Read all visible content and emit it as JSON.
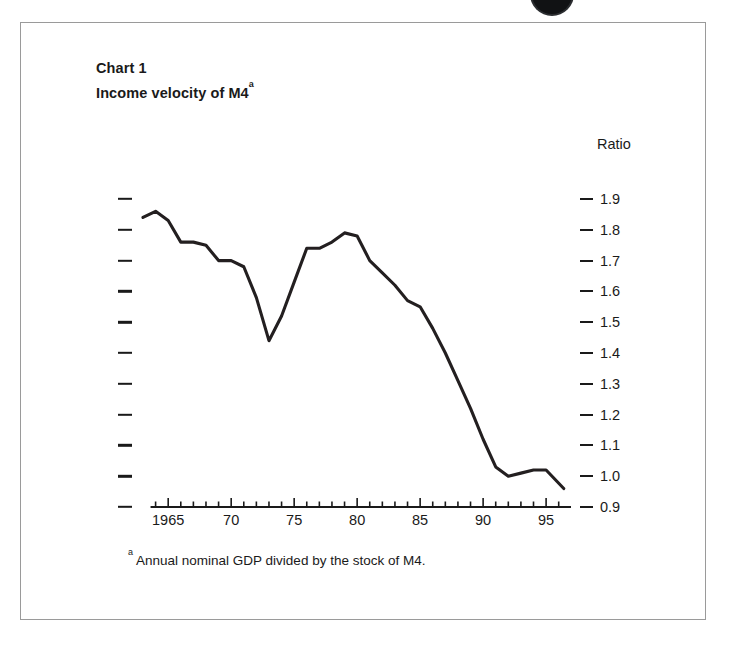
{
  "page": {
    "background": "#ffffff",
    "ink": "#1a1a1a",
    "frame_color": "#9a9a9a",
    "artifact": "page-edge-dark-circle"
  },
  "titles": {
    "chart_number": "Chart 1",
    "chart_title": "Income velocity of M4",
    "title_footnote_marker": "a"
  },
  "axis": {
    "ratio_label": "Ratio",
    "y_tick_labels": [
      "1.9",
      "1.8",
      "1.7",
      "1.6",
      "1.5",
      "1.4",
      "1.3",
      "1.2",
      "1.1",
      "1.0",
      "0.9"
    ],
    "x_tick_labels": [
      "1965",
      "70",
      "75",
      "80",
      "85",
      "90",
      "95"
    ]
  },
  "footnote": {
    "marker": "a",
    "text": "Annual nominal GDP divided by the stock of M4."
  },
  "chart_data": {
    "type": "line",
    "title": "Income velocity of M4",
    "subtitle": "Chart 1",
    "xlabel": "",
    "ylabel": "Ratio",
    "xlim": [
      1963,
      1996.5
    ],
    "ylim": [
      0.9,
      1.9
    ],
    "grid": false,
    "legend": null,
    "y_major_ticks": [
      0.9,
      1.0,
      1.1,
      1.2,
      1.3,
      1.4,
      1.5,
      1.6,
      1.7,
      1.8,
      1.9
    ],
    "x_major_ticks": [
      1965,
      1970,
      1975,
      1980,
      1985,
      1990,
      1995
    ],
    "x_minor_tick_step": 1,
    "line_color": "#231f20",
    "line_width_px": 3.1,
    "x": [
      1963,
      1964,
      1965,
      1966,
      1967,
      1968,
      1969,
      1970,
      1971,
      1972,
      1973,
      1974,
      1975,
      1976,
      1977,
      1978,
      1979,
      1980,
      1981,
      1982,
      1983,
      1984,
      1985,
      1986,
      1987,
      1988,
      1989,
      1990,
      1991,
      1992,
      1993,
      1994,
      1995,
      1996.4
    ],
    "values": [
      1.84,
      1.86,
      1.83,
      1.76,
      1.76,
      1.75,
      1.7,
      1.7,
      1.68,
      1.58,
      1.44,
      1.52,
      1.63,
      1.74,
      1.74,
      1.76,
      1.79,
      1.78,
      1.7,
      1.66,
      1.62,
      1.57,
      1.55,
      1.48,
      1.4,
      1.31,
      1.22,
      1.12,
      1.03,
      1.0,
      1.01,
      1.02,
      1.02,
      0.96
    ],
    "annotations": [
      {
        "label": "trough",
        "x": 1973,
        "y": 1.44
      },
      {
        "label": "peak",
        "x": 1979,
        "y": 1.79
      },
      {
        "label": "minimum",
        "x": 1992,
        "y": 1.0
      }
    ]
  }
}
